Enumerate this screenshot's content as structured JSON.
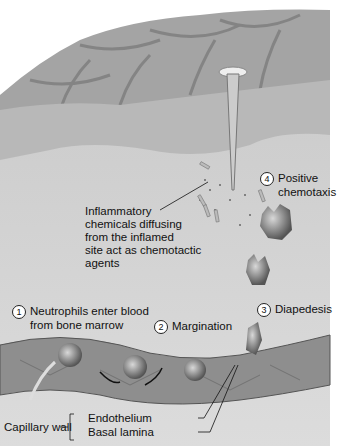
{
  "diagram": {
    "title": "",
    "labels": {
      "inflammatory": [
        "Inflammatory",
        "chemicals diffusing",
        "from the inflamed",
        "site act as chemotactic",
        "agents"
      ],
      "step1": {
        "number": "1",
        "lines": [
          "Neutrophils enter blood",
          "from bone marrow"
        ]
      },
      "step2": {
        "number": "2",
        "text": "Margination"
      },
      "step3": {
        "number": "3",
        "text": "Diapedesis"
      },
      "step4": {
        "number": "4",
        "lines": [
          "Positive",
          "chemotaxis"
        ]
      },
      "capillary_wall": "Capillary wall",
      "endothelium": "Endothelium",
      "basal_lamina": "Basal lamina"
    },
    "colors": {
      "skin": "#a8a8a8",
      "dermis": "#c4c4c4",
      "tissue": "#d6d6d6",
      "vessel": "#8e8e8e",
      "cell": "#6a6a6a"
    }
  }
}
